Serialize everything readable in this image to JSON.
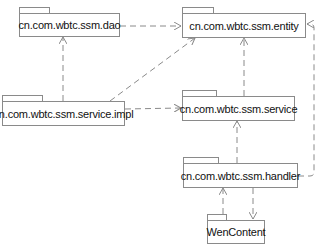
{
  "diagram": {
    "type": "uml-package-dependency",
    "packages": [
      {
        "id": "dao",
        "label": "cn.com.wbtc.ssm.dao"
      },
      {
        "id": "entity",
        "label": "cn.com.wbtc.ssm.entity"
      },
      {
        "id": "service_impl",
        "label": "cn.com.wbtc.ssm.service.impl"
      },
      {
        "id": "service",
        "label": "cn.com.wbtc.ssm.service"
      },
      {
        "id": "handler",
        "label": "cn.com.wbtc.ssm.handler"
      },
      {
        "id": "wencontent",
        "label": "WenContent"
      }
    ],
    "dependencies": [
      {
        "from": "dao",
        "to": "entity"
      },
      {
        "from": "service_impl",
        "to": "dao"
      },
      {
        "from": "service_impl",
        "to": "entity"
      },
      {
        "from": "service_impl",
        "to": "service"
      },
      {
        "from": "service",
        "to": "entity"
      },
      {
        "from": "handler",
        "to": "service"
      },
      {
        "from": "handler",
        "to": "entity"
      },
      {
        "from": "handler",
        "to": "wencontent"
      },
      {
        "from": "wencontent",
        "to": "handler"
      }
    ],
    "colors": {
      "line": "#8a8a8a",
      "text": "#111111",
      "background": "#ffffff"
    }
  }
}
